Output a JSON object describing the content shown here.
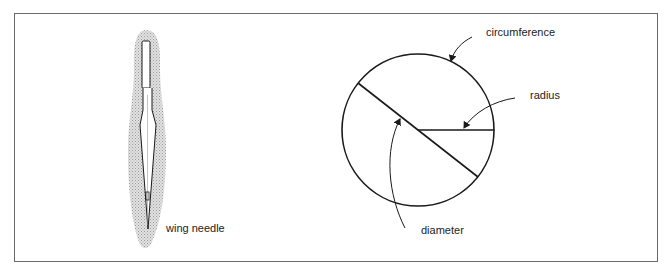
{
  "heading_fragment": "",
  "figures": {
    "needle": {
      "label": "wing needle"
    },
    "circle": {
      "labels": {
        "circumference": "circumference",
        "radius": "radius",
        "diameter": "diameter"
      }
    }
  },
  "colors": {
    "line": "#1a1a1a",
    "frame": "#6a6a6a",
    "halo": "#c8c8c8"
  }
}
